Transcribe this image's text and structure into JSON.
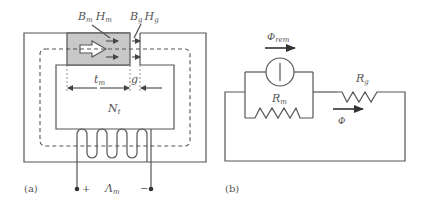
{
  "figure_a": {
    "caption": "(a)",
    "magnet_label_B": "B",
    "magnet_label_B_sub": "m",
    "magnet_label_H": "H",
    "magnet_label_H_sub": "m",
    "gap_label_B": "B",
    "gap_label_B_sub": "g",
    "gap_label_H": "H",
    "gap_label_H_sub": "g",
    "magnet_length_label": "t",
    "magnet_length_sub": "m",
    "gap_length_label": "g",
    "turns_label": "N",
    "turns_sub": "t",
    "plus_terminal": "+",
    "minus_terminal": "−",
    "flux_linkage_label": "Λ",
    "flux_linkage_sub": "m",
    "magnet_fill": "#c8c8c8"
  },
  "figure_b": {
    "caption": "(b)",
    "remanent_flux_label": "Φ",
    "remanent_flux_sub": "rem",
    "magnet_reluctance_label": "R",
    "magnet_reluctance_sub": "m",
    "gap_reluctance_label": "R",
    "gap_reluctance_sub": "g",
    "flux_label": "Φ"
  }
}
